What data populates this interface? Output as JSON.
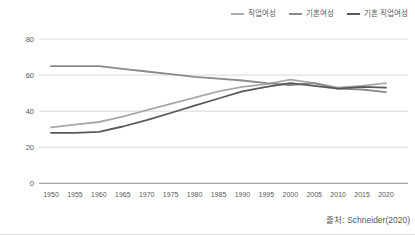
{
  "chart_data": {
    "type": "line",
    "title": "",
    "xlabel": "",
    "ylabel": "",
    "categories": [
      "1950",
      "1955",
      "1960",
      "1965",
      "1970",
      "1975",
      "1980",
      "1985",
      "1990",
      "1995",
      "2000",
      "2005",
      "2010",
      "2015",
      "2020"
    ],
    "series": [
      {
        "name": "직업여성",
        "color": "#a9a9a9",
        "values": [
          31,
          32.5,
          34,
          37,
          40.5,
          44,
          47.5,
          51,
          53.5,
          55,
          57.5,
          55.5,
          53,
          54,
          55.5
        ]
      },
      {
        "name": "기혼여성",
        "color": "#8a8a8a",
        "values": [
          65,
          65,
          65,
          63.5,
          62,
          60.5,
          59,
          58,
          57,
          55.5,
          54.5,
          55.5,
          52.5,
          52,
          50.5
        ]
      },
      {
        "name": "기혼 직업여성",
        "color": "#595959",
        "values": [
          28,
          28,
          28.5,
          31.5,
          35,
          39,
          43,
          47,
          51,
          53.5,
          55.5,
          54,
          52.5,
          53.5,
          53
        ]
      }
    ],
    "ylim": [
      0,
      80
    ],
    "yticks": [
      0,
      20,
      40,
      60,
      80
    ],
    "grid": true,
    "legend_position": "top-right",
    "gridline_color": "#d9d9d9",
    "axis_color": "#a6a6a6",
    "text_color": "#595959"
  },
  "source_label": "출처: Schneider(2020)"
}
